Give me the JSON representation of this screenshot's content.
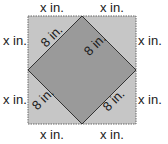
{
  "diagram": {
    "outer_square": {
      "fill": "#c6c6c6",
      "border": "#555555",
      "border_style": "dotted"
    },
    "inner_square": {
      "fill": "#9a9a9a",
      "stroke": "#333333"
    },
    "labels": {
      "top_left": "x in.",
      "top_right": "x in.",
      "left_top": "x in.",
      "left_bottom": "x in.",
      "right_top": "x in.",
      "right_bottom": "x in.",
      "bottom_left": "x in.",
      "bottom_right": "x in.",
      "diamond_upper_left": "8 in.",
      "diamond_upper_right": "8 in.",
      "diamond_lower_left": "8 in.",
      "diamond_lower_right": "8 in."
    }
  }
}
